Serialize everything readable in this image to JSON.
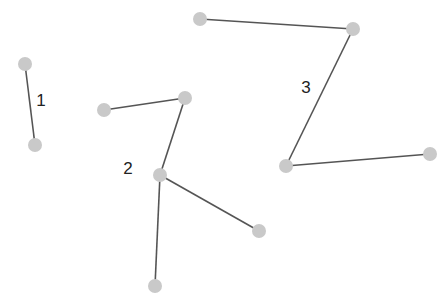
{
  "diagram": {
    "type": "graph-connected-components",
    "node_color": "#c9c9c9",
    "edge_color": "#555555",
    "label_color": "#222222",
    "components": [
      {
        "label": "1",
        "label_pos": [
          41,
          106
        ],
        "nodes": [
          [
            25,
            64
          ],
          [
            35,
            145
          ]
        ],
        "edges": [
          [
            0,
            1
          ]
        ]
      },
      {
        "label": "2",
        "label_pos": [
          128,
          174
        ],
        "nodes": [
          [
            104,
            110
          ],
          [
            185,
            98
          ],
          [
            160,
            175
          ],
          [
            259,
            231
          ],
          [
            155,
            286
          ]
        ],
        "edges": [
          [
            0,
            1
          ],
          [
            1,
            2
          ],
          [
            2,
            3
          ],
          [
            2,
            4
          ]
        ]
      },
      {
        "label": "3",
        "label_pos": [
          306,
          93
        ],
        "nodes": [
          [
            200,
            19
          ],
          [
            353,
            29
          ],
          [
            286,
            166
          ],
          [
            430,
            154
          ]
        ],
        "edges": [
          [
            0,
            1
          ],
          [
            1,
            2
          ],
          [
            2,
            3
          ]
        ]
      }
    ]
  }
}
